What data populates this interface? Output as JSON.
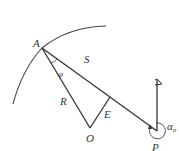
{
  "diagram": {
    "type": "geometry",
    "colors": {
      "line": "#333333",
      "background": "#ffffff"
    },
    "points": {
      "A": {
        "label": "A",
        "x": 42,
        "y": 48
      },
      "O": {
        "label": "O",
        "x": 90,
        "y": 128
      },
      "E": {
        "label": "E",
        "x": 110,
        "y": 98
      },
      "P": {
        "label": "P",
        "x": 157,
        "y": 131
      }
    },
    "segments": [
      {
        "from": "A",
        "to": "O",
        "label": "R"
      },
      {
        "from": "A",
        "to": "P",
        "label": "S"
      },
      {
        "from": "O",
        "to": "E",
        "label": "E"
      }
    ],
    "labels": {
      "A": "A",
      "S": "S",
      "phi": "φ",
      "R": "R",
      "O": "O",
      "E": "E",
      "P": "P",
      "alpha": "α",
      "alpha_sub": "o"
    },
    "elements": [
      "arc through A",
      "vertical pole with flag at P",
      "rotation arrow around P"
    ]
  }
}
